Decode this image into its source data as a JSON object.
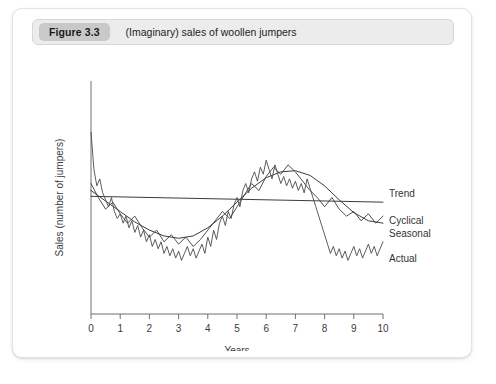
{
  "figure": {
    "badge": "Figure 3.3",
    "caption": "(Imaginary) sales of woollen jumpers"
  },
  "chart_data": {
    "type": "line",
    "title": "(Imaginary) sales of woollen jumpers",
    "xlabel": "Years",
    "ylabel": "Sales (number of jumpers)",
    "xlim": [
      0,
      10
    ],
    "ylim": [
      0,
      100
    ],
    "xticks": [
      0,
      1,
      2,
      3,
      4,
      5,
      6,
      7,
      8,
      9,
      10
    ],
    "xticklabels": [
      "0",
      "1",
      "2",
      "3",
      "4",
      "5",
      "6",
      "7",
      "8",
      "9",
      "10"
    ],
    "yticks": [],
    "yticklabels": [],
    "grid": false,
    "legend_position": "right-inline",
    "legend": [
      "Trend",
      "Cyclical",
      "Seasonal",
      "Actual"
    ],
    "series": [
      {
        "name": "Trend",
        "color": "#3c3c3c",
        "x": [
          0,
          10
        ],
        "values": [
          50.5,
          48.0
        ]
      },
      {
        "name": "Cyclical",
        "color": "#3c3c3c",
        "x": [
          0,
          0.5,
          1,
          1.5,
          2,
          2.5,
          3,
          3.5,
          4,
          4.5,
          5,
          5.5,
          6,
          6.5,
          7,
          7.5,
          8,
          8.5,
          9,
          9.5,
          10
        ],
        "values": [
          53,
          48.5,
          44,
          39.5,
          36,
          33.5,
          32.5,
          33.5,
          37,
          42,
          48,
          54,
          58.5,
          61,
          61.5,
          59.5,
          55,
          49,
          43.5,
          40,
          39
        ]
      },
      {
        "name": "Seasonal",
        "color": "#3c3c3c",
        "x": [
          0,
          0.25,
          0.5,
          0.75,
          1,
          1.25,
          1.5,
          1.75,
          2,
          2.25,
          2.5,
          2.75,
          3,
          3.25,
          3.5,
          3.75,
          4,
          4.25,
          4.5,
          4.75,
          5,
          5.25,
          5.5,
          5.75,
          6,
          6.25,
          6.5,
          6.75,
          7,
          7.25,
          7.5,
          7.75,
          8,
          8.25,
          8.5,
          8.75,
          9,
          9.25,
          9.5,
          9.75,
          10
        ],
        "values": [
          56,
          50,
          45,
          48,
          43,
          39,
          42,
          37,
          33,
          36,
          31,
          34,
          30,
          33,
          29,
          32,
          36,
          40,
          44,
          41,
          46,
          51,
          56,
          53,
          59,
          63,
          60,
          64,
          61,
          57,
          53,
          50,
          46,
          50,
          45,
          42,
          44,
          40,
          43,
          39,
          42
        ]
      },
      {
        "name": "Actual",
        "color": "#4a4a4a",
        "x": [
          0,
          0.1,
          0.2,
          0.3,
          0.4,
          0.5,
          0.6,
          0.7,
          0.8,
          0.9,
          1,
          1.1,
          1.2,
          1.3,
          1.4,
          1.5,
          1.6,
          1.7,
          1.8,
          1.9,
          2,
          2.1,
          2.2,
          2.3,
          2.4,
          2.5,
          2.6,
          2.7,
          2.8,
          2.9,
          3,
          3.1,
          3.2,
          3.3,
          3.4,
          3.5,
          3.6,
          3.7,
          3.8,
          3.9,
          4,
          4.1,
          4.2,
          4.3,
          4.4,
          4.5,
          4.6,
          4.7,
          4.8,
          4.9,
          5,
          5.1,
          5.2,
          5.3,
          5.4,
          5.5,
          5.6,
          5.7,
          5.8,
          5.9,
          6,
          6.1,
          6.2,
          6.3,
          6.4,
          6.5,
          6.6,
          6.7,
          6.8,
          6.9,
          7,
          7.1,
          7.2,
          7.3,
          7.4,
          7.5,
          7.6,
          7.7,
          7.8,
          7.9,
          8,
          8.1,
          8.2,
          8.3,
          8.4,
          8.5,
          8.6,
          8.7,
          8.8,
          8.9,
          9,
          9.1,
          9.2,
          9.3,
          9.4,
          9.5,
          9.6,
          9.7,
          9.8,
          9.9,
          10
        ],
        "values": [
          78,
          62,
          55,
          58,
          52,
          49,
          46,
          50,
          44,
          41,
          43,
          39,
          42,
          37,
          40,
          35,
          38,
          33,
          36,
          31,
          34,
          29,
          32,
          28,
          31,
          26,
          29,
          25,
          28,
          24,
          27,
          23,
          26,
          29,
          25,
          28,
          24,
          27,
          30,
          26,
          33,
          29,
          36,
          32,
          39,
          42,
          38,
          44,
          41,
          47,
          50,
          46,
          53,
          56,
          52,
          58,
          61,
          57,
          63,
          60,
          66,
          62,
          58,
          64,
          60,
          56,
          59,
          55,
          58,
          54,
          57,
          53,
          56,
          52,
          58,
          54,
          50,
          46,
          42,
          38,
          34,
          30,
          26,
          29,
          25,
          28,
          24,
          27,
          23,
          26,
          29,
          25,
          28,
          24,
          27,
          30,
          26,
          29,
          25,
          28,
          31
        ]
      }
    ],
    "annotations": []
  }
}
